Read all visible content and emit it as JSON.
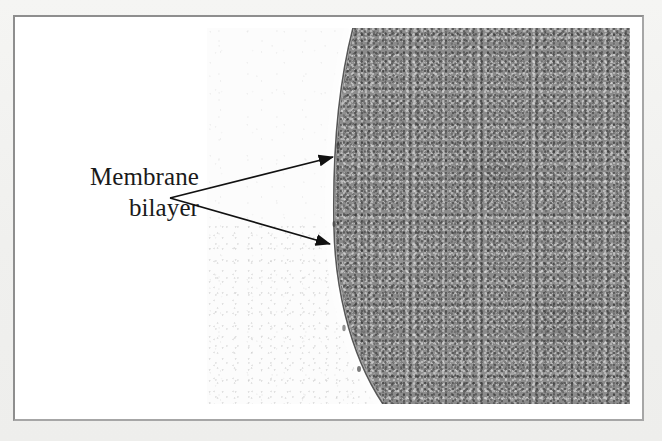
{
  "figure": {
    "kind": "electron-micrograph",
    "caption_label": {
      "line1": "Membrane",
      "line2": "bilayer"
    },
    "annotations": [
      {
        "name": "arrow-upper",
        "target": "outer leaflet / upper membrane bilayer",
        "from_x": 168,
        "from_y": 196,
        "to_x": 333,
        "to_y": 155
      },
      {
        "name": "arrow-lower",
        "target": "inner leaflet / lower membrane bilayer",
        "from_x": 168,
        "from_y": 196,
        "to_x": 330,
        "to_y": 242
      }
    ],
    "regions": [
      {
        "name": "extracellular-space",
        "description": "light, nearly featureless region left of the membrane"
      },
      {
        "name": "membrane-bilayer",
        "description": "thin dark line with bright halo tracing the curved cell boundary"
      },
      {
        "name": "cytoplasm",
        "description": "dark, finely granular region right of the membrane"
      }
    ],
    "colors": {
      "page_background": "#f2f2f0",
      "plate_background": "#ffffff",
      "frame_border": "#9a9a9a",
      "micrograph_light": "#fcfcfc",
      "micrograph_dark": "#8b8b8b",
      "membrane_line": "#2e2e2e",
      "membrane_halo": "#ffffff",
      "arrow_color": "#111111",
      "label_color": "#1a1a1a"
    }
  }
}
